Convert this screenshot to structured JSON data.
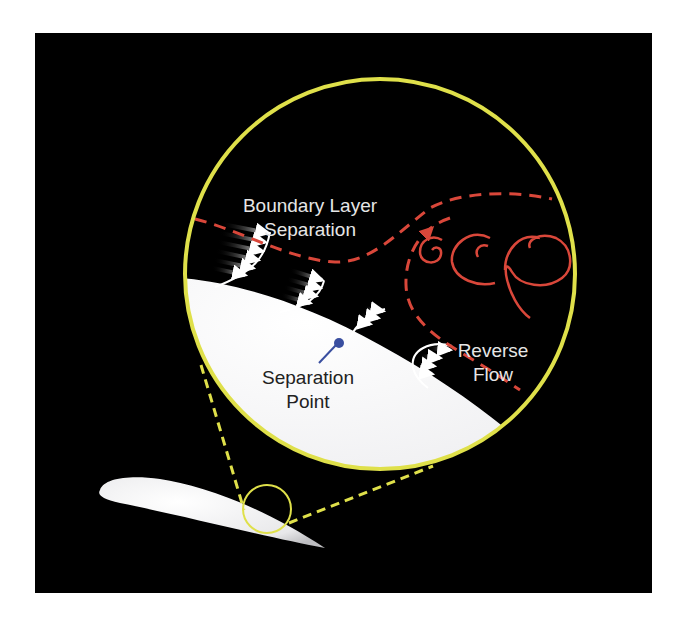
{
  "diagram": {
    "labels": {
      "separation_line_l1": "Boundary Layer",
      "separation_line_l2": "Separation",
      "separation_point_l1": "Separation",
      "separation_point_l2": "Point",
      "reverse_flow_l1": "Reverse",
      "reverse_flow_l2": "Flow"
    },
    "colors": {
      "background": "#000000",
      "magnifier": "#dfe04a",
      "separation_line": "#d9473a",
      "vortex": "#d9473a",
      "surface": "#f2f2f4",
      "profile": "#ffffff",
      "separation_point": "#3a4fa0",
      "label_on_dark": "#e6e6e6",
      "label_on_light": "#222222"
    },
    "elements": [
      "airfoil",
      "magnifier-small-circle",
      "magnifier-large-circle",
      "velocity-profile (attached) x2",
      "velocity-profile (near separation)",
      "velocity-profile (reverse flow)",
      "boundary-layer-separation-line",
      "vortices x3",
      "separation-point marker"
    ]
  }
}
